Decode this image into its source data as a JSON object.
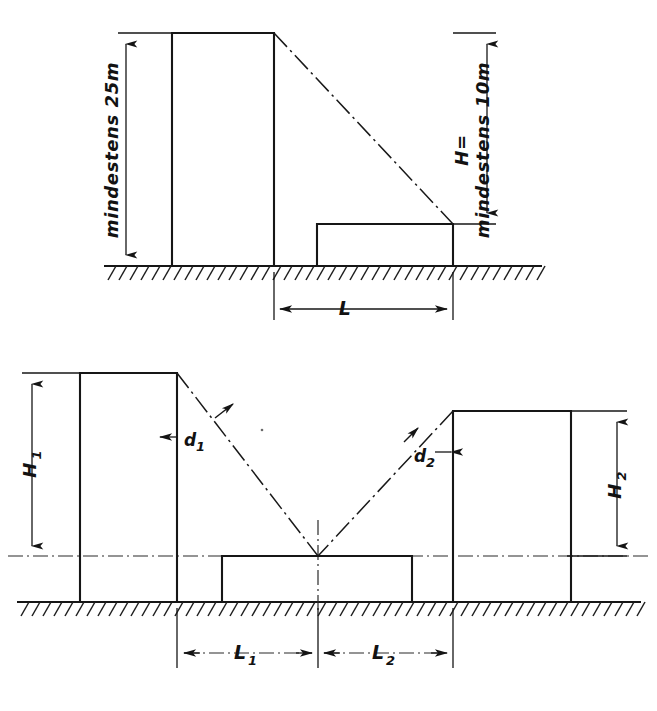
{
  "figure": {
    "ink_color": "#161616",
    "background_color": "#ffffff"
  },
  "upper_diagram": {
    "name": "oberes Schnittbild",
    "left_height_label": "mindestens 25m",
    "right_height_label_line1": "H=",
    "right_height_label_line2": "mindestens 10m",
    "length_label": "L",
    "buildings": [
      {
        "id": "tall-building",
        "role": "hohes Gebaeude"
      },
      {
        "id": "low-building",
        "role": "niedriges Gebaeude"
      }
    ],
    "sight_line": "Verbindungslinie Oberkante hoch zu Oberkante niedrig"
  },
  "lower_diagram": {
    "name": "unteres Schnittbild",
    "left_height_label": "H",
    "left_height_sub": "1",
    "right_height_label": "H",
    "right_height_sub": "2",
    "left_distance_label": "d",
    "left_distance_sub": "1",
    "right_distance_label": "d",
    "right_distance_sub": "2",
    "left_length_label": "L",
    "left_length_sub": "1",
    "right_length_label": "L",
    "right_length_sub": "2",
    "buildings": [
      {
        "id": "left-building",
        "role": "linkes Gebaeude"
      },
      {
        "id": "center-low-building",
        "role": "mittleres niedriges Gebaeude"
      },
      {
        "id": "right-building",
        "role": "rechtes Gebaeude"
      }
    ],
    "convergence_note": "Schnittpunkt der beiden Sichtlinien auf der Dachebene"
  }
}
